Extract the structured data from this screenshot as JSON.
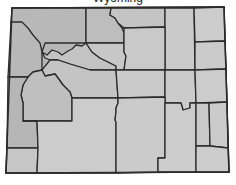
{
  "map": {
    "title_partial": "Wyoming",
    "colors": {
      "fill_west": "#b4b4b4",
      "fill_default": "#c8c8c8",
      "fill_light": "#cfcfcf",
      "stroke": "#2b2b2b",
      "background": "#ffffff"
    },
    "counties": [
      {
        "id": "park"
      },
      {
        "id": "big-horn"
      },
      {
        "id": "sheridan"
      },
      {
        "id": "campbell"
      },
      {
        "id": "crook"
      },
      {
        "id": "weston"
      },
      {
        "id": "teton"
      },
      {
        "id": "hot-springs"
      },
      {
        "id": "washakie"
      },
      {
        "id": "johnson"
      },
      {
        "id": "fremont"
      },
      {
        "id": "natrona"
      },
      {
        "id": "converse"
      },
      {
        "id": "niobrara"
      },
      {
        "id": "sublette"
      },
      {
        "id": "lincoln"
      },
      {
        "id": "uinta"
      },
      {
        "id": "sweetwater"
      },
      {
        "id": "carbon"
      },
      {
        "id": "albany"
      },
      {
        "id": "platte"
      },
      {
        "id": "goshen"
      },
      {
        "id": "laramie"
      }
    ]
  }
}
